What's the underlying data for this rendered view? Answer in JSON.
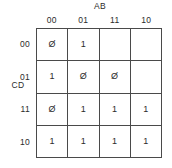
{
  "diagram": {
    "type": "karnaugh-map",
    "top_variables_label": "AB",
    "side_variables_label": "CD",
    "column_headers": [
      "00",
      "01",
      "11",
      "10"
    ],
    "row_headers": [
      "00",
      "01",
      "11",
      "10"
    ],
    "cells": [
      [
        "Ø",
        "1",
        "",
        ""
      ],
      [
        "1",
        "Ø",
        "Ø",
        ""
      ],
      [
        "Ø",
        "1",
        "1",
        "1"
      ],
      [
        "1",
        "1",
        "1",
        "1"
      ]
    ],
    "colors": {
      "grid_line": "#4a4a4a",
      "text": "#2b2b2b",
      "background": "#ffffff"
    }
  }
}
